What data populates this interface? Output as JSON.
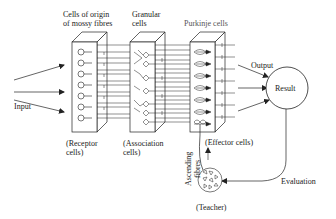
{
  "diagram": {
    "colors": {
      "stroke": "#222222",
      "background": "#ffffff",
      "label_light": "#555555"
    },
    "labels": {
      "input": "Input",
      "mossy_header_line1": "Cells of origin",
      "mossy_header_line2": "of mossy fibres",
      "granular_header_line1": "Granular",
      "granular_header_line2": "cells",
      "purkinje_header": "Purkinje cells",
      "receptor_line1": "(Receptor",
      "receptor_line2": "cells)",
      "association_line1": "(Association",
      "association_line2": "cells)",
      "effector": "(Effector cells)",
      "output": "Output",
      "result": "Result",
      "evaluation": "Evaluation",
      "teacher": "(Teacher)",
      "ascending_line1": "Ascending",
      "ascending_line2": "fibres"
    },
    "nodes": [
      {
        "id": "input",
        "label": "Input"
      },
      {
        "id": "mossy",
        "label": "Cells of origin of mossy fibres",
        "role": "Receptor cells"
      },
      {
        "id": "granular",
        "label": "Granular cells",
        "role": "Association cells"
      },
      {
        "id": "purkinje",
        "label": "Purkinje cells",
        "role": "Effector cells"
      },
      {
        "id": "result",
        "label": "Result"
      },
      {
        "id": "teacher",
        "label": "Teacher"
      }
    ],
    "edges": [
      {
        "from": "input",
        "to": "mossy",
        "label": "Input"
      },
      {
        "from": "mossy",
        "to": "granular"
      },
      {
        "from": "granular",
        "to": "purkinje"
      },
      {
        "from": "purkinje",
        "to": "result",
        "label": "Output"
      },
      {
        "from": "result",
        "to": "teacher",
        "label": "Evaluation"
      },
      {
        "from": "teacher",
        "to": "purkinje",
        "label": "Ascending fibres"
      }
    ]
  }
}
